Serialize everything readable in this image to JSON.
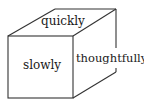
{
  "diagram": {
    "type": "cube",
    "labels": {
      "top": "quickly",
      "front": "slowly",
      "side": "thoughtfully"
    },
    "stroke_color": "#333333",
    "background": "#ffffff"
  }
}
